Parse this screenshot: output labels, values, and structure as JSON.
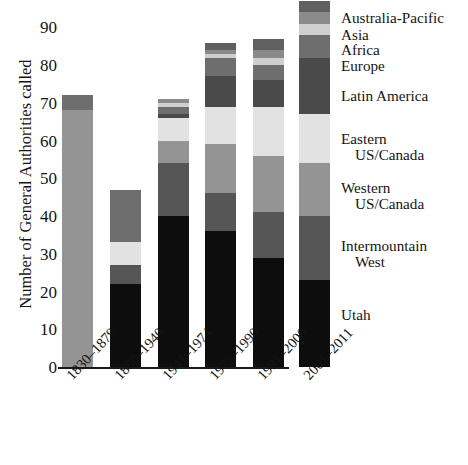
{
  "chart_data": {
    "type": "bar",
    "stacked": true,
    "title": "",
    "xlabel": "",
    "ylabel": "Number of General Authorities called",
    "ylim": [
      0,
      90
    ],
    "yticks": [
      0,
      10,
      20,
      30,
      40,
      50,
      60,
      70,
      80,
      90
    ],
    "grid": false,
    "legend_position": "right",
    "categories": [
      "1830–1879",
      "1880–1940",
      "1941–1974",
      "1975–1990",
      "1991–2000",
      "2001–2011"
    ],
    "totals": [
      72,
      47,
      71,
      86,
      87,
      97
    ],
    "series": [
      {
        "name": "Utah",
        "color": "#0d0d0d",
        "values": [
          0,
          22,
          40,
          36,
          29,
          23
        ]
      },
      {
        "name": "Intermountain West",
        "color": "#565656",
        "values": [
          0,
          5,
          14,
          10,
          12,
          17
        ]
      },
      {
        "name": "Western US/Canada",
        "color": "#949494",
        "values": [
          68,
          0,
          6,
          13,
          15,
          14
        ]
      },
      {
        "name": "Eastern US/Canada",
        "color": "#e2e2e2",
        "values": [
          0,
          6,
          6,
          10,
          13,
          13
        ]
      },
      {
        "name": "Latin America",
        "color": "#4a4a4a",
        "values": [
          0,
          0,
          1,
          8,
          7,
          15
        ]
      },
      {
        "name": "Europe",
        "color": "#6e6e6e",
        "values": [
          4,
          14,
          2,
          5,
          4,
          6
        ]
      },
      {
        "name": "Africa",
        "color": "#cfcfcf",
        "values": [
          0,
          0,
          1,
          1,
          2,
          3
        ]
      },
      {
        "name": "Asia",
        "color": "#8a8a8a",
        "values": [
          0,
          0,
          1,
          1,
          2,
          3
        ]
      },
      {
        "name": "Australia-Pacific",
        "color": "#606060",
        "values": [
          0,
          0,
          0,
          2,
          3,
          3
        ]
      }
    ]
  },
  "axis": {
    "yticks": [
      "0",
      "10",
      "20",
      "30",
      "40",
      "50",
      "60",
      "70",
      "80",
      "90"
    ],
    "ylabel": "Number of General Authorities called",
    "xticks": [
      "1830–1879",
      "1880–1940",
      "1941–1974",
      "1975–1990",
      "1991–2000",
      "2001–2011"
    ]
  },
  "legend": {
    "entries": [
      {
        "label": "Australia-Pacific",
        "line1": "Australia-Pacific",
        "line2": ""
      },
      {
        "label": "Asia",
        "line1": "Asia",
        "line2": ""
      },
      {
        "label": "Africa",
        "line1": "Africa",
        "line2": ""
      },
      {
        "label": "Europe",
        "line1": "Europe",
        "line2": ""
      },
      {
        "label": "Latin America",
        "line1": "Latin America",
        "line2": ""
      },
      {
        "label": "Eastern US/Canada",
        "line1": "Eastern",
        "line2": "US/Canada"
      },
      {
        "label": "Western US/Canada",
        "line1": "Western",
        "line2": "US/Canada"
      },
      {
        "label": "Intermountain West",
        "line1": "Intermountain",
        "line2": "West"
      },
      {
        "label": "Utah",
        "line1": "Utah",
        "line2": ""
      }
    ]
  }
}
